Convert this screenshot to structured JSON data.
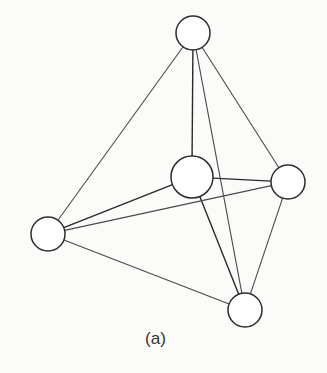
{
  "figure": {
    "caption": "(a)",
    "graph_type": "complete graph K5",
    "colors": {
      "background": "#fbfbfa",
      "node_fill": "#ffffff",
      "node_stroke": "#2e2e2e",
      "edge": "#4a4a4a",
      "edge_dark": "#2a2a2a"
    },
    "nodes": [
      {
        "id": "top",
        "x": 193,
        "y": 33,
        "r": 17
      },
      {
        "id": "middle",
        "x": 192,
        "y": 177,
        "r": 21
      },
      {
        "id": "right",
        "x": 288,
        "y": 182,
        "r": 17
      },
      {
        "id": "left",
        "x": 48,
        "y": 234,
        "r": 17
      },
      {
        "id": "bottom",
        "x": 245,
        "y": 310,
        "r": 17
      }
    ],
    "edges": [
      {
        "from": "top",
        "to": "left",
        "dark": false
      },
      {
        "from": "top",
        "to": "middle",
        "dark": true
      },
      {
        "from": "top",
        "to": "right",
        "dark": false
      },
      {
        "from": "top",
        "to": "bottom",
        "dark": false
      },
      {
        "from": "middle",
        "to": "left",
        "dark": true
      },
      {
        "from": "middle",
        "to": "right",
        "dark": true
      },
      {
        "from": "middle",
        "to": "bottom",
        "dark": true
      },
      {
        "from": "left",
        "to": "right",
        "dark": false
      },
      {
        "from": "left",
        "to": "bottom",
        "dark": false
      },
      {
        "from": "right",
        "to": "bottom",
        "dark": false
      }
    ]
  }
}
